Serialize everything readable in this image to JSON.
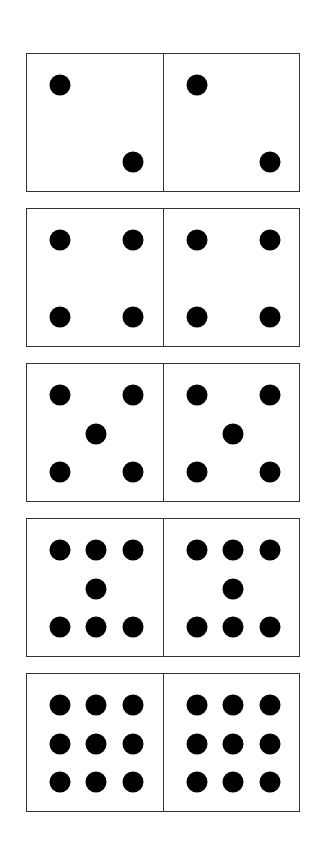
{
  "colors": {
    "dot": "#000000",
    "border": "#333333",
    "background": "#ffffff"
  },
  "layout": {
    "domino_left": 26,
    "domino_width": 274,
    "domino_height": 139,
    "domino_tops": [
      53,
      208,
      363,
      518,
      673
    ],
    "columns": {
      "left": 33,
      "middle": 69,
      "right": 106
    },
    "rows": {
      "top": 31,
      "middle": 70,
      "bottom": 108
    }
  },
  "dominoes": [
    {
      "name": "domino-2-2",
      "left_count": 2,
      "right_count": 2,
      "pattern": [
        [
          "left",
          "top"
        ],
        [
          "right",
          "bottom"
        ]
      ]
    },
    {
      "name": "domino-4-4",
      "left_count": 4,
      "right_count": 4,
      "pattern": [
        [
          "left",
          "top"
        ],
        [
          "right",
          "top"
        ],
        [
          "left",
          "bottom"
        ],
        [
          "right",
          "bottom"
        ]
      ]
    },
    {
      "name": "domino-5-5",
      "left_count": 5,
      "right_count": 5,
      "pattern": [
        [
          "left",
          "top"
        ],
        [
          "right",
          "top"
        ],
        [
          "middle",
          "middle"
        ],
        [
          "left",
          "bottom"
        ],
        [
          "right",
          "bottom"
        ]
      ]
    },
    {
      "name": "domino-7-7",
      "left_count": 7,
      "right_count": 7,
      "pattern": [
        [
          "left",
          "top"
        ],
        [
          "middle",
          "top"
        ],
        [
          "right",
          "top"
        ],
        [
          "middle",
          "middle"
        ],
        [
          "left",
          "bottom"
        ],
        [
          "middle",
          "bottom"
        ],
        [
          "right",
          "bottom"
        ]
      ]
    },
    {
      "name": "domino-9-9",
      "left_count": 9,
      "right_count": 9,
      "pattern": [
        [
          "left",
          "top"
        ],
        [
          "middle",
          "top"
        ],
        [
          "right",
          "top"
        ],
        [
          "left",
          "middle"
        ],
        [
          "middle",
          "middle"
        ],
        [
          "right",
          "middle"
        ],
        [
          "left",
          "bottom"
        ],
        [
          "middle",
          "bottom"
        ],
        [
          "right",
          "bottom"
        ]
      ]
    }
  ]
}
